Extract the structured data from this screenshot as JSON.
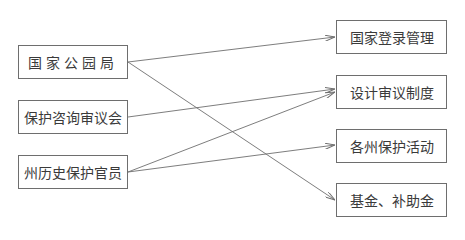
{
  "diagram": {
    "type": "bipartite-flow",
    "left_nodes": [
      {
        "id": "L1",
        "label": "国家公园局"
      },
      {
        "id": "L2",
        "label": "保护咨询审议会"
      },
      {
        "id": "L3",
        "label": "州历史保护官员"
      }
    ],
    "right_nodes": [
      {
        "id": "R1",
        "label": "国家登录管理"
      },
      {
        "id": "R2",
        "label": "设计审议制度"
      },
      {
        "id": "R3",
        "label": "各州保护活动"
      },
      {
        "id": "R4",
        "label": "基金、补助金"
      }
    ],
    "edges": [
      {
        "from": "L1",
        "to": "R1"
      },
      {
        "from": "L1",
        "to": "R4"
      },
      {
        "from": "L2",
        "to": "R2"
      },
      {
        "from": "L3",
        "to": "R2"
      },
      {
        "from": "L3",
        "to": "R3"
      }
    ],
    "colors": {
      "line": "#6e6e6e",
      "text": "#3a3a3a",
      "background": "#ffffff"
    }
  }
}
